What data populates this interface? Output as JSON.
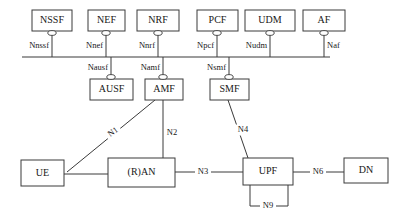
{
  "diagram": {
    "style": {
      "stroke_color": "#3a3a3a",
      "text_color": "#171717",
      "background": "#ffffff"
    },
    "service_bus": {
      "name": "service-based-interface-bus",
      "x1": 22,
      "y": 57,
      "x2": 330
    },
    "top_nodes": [
      {
        "id": "nssf",
        "label": "NSSF",
        "x": 32,
        "y": 10,
        "w": 40,
        "h": 21,
        "service": "Nnssf",
        "service_side": "left",
        "stem_x": 52
      },
      {
        "id": "nef",
        "label": "NEF",
        "x": 88,
        "y": 10,
        "w": 37,
        "h": 21,
        "service": "Nnef",
        "service_side": "left",
        "stem_x": 106
      },
      {
        "id": "nrf",
        "label": "NRF",
        "x": 137,
        "y": 10,
        "w": 42,
        "h": 21,
        "service": "Nnrf",
        "service_side": "left",
        "stem_x": 158
      },
      {
        "id": "pcf",
        "label": "PCF",
        "x": 197,
        "y": 10,
        "w": 41,
        "h": 21,
        "service": "Npcf",
        "service_side": "left",
        "stem_x": 217
      },
      {
        "id": "udm",
        "label": "UDM",
        "x": 245,
        "y": 10,
        "w": 50,
        "h": 21,
        "service": "Nudm",
        "service_side": "left",
        "stem_x": 270
      },
      {
        "id": "af",
        "label": "AF",
        "x": 303,
        "y": 10,
        "w": 42,
        "h": 21,
        "service": "Naf",
        "service_side": "right",
        "stem_x": 324
      }
    ],
    "mid_nodes": [
      {
        "id": "ausf",
        "label": "AUSF",
        "x": 90,
        "y": 79,
        "w": 43,
        "h": 21,
        "service": "Nausf",
        "service_side": "left",
        "stem_x": 111
      },
      {
        "id": "amf",
        "label": "AMF",
        "x": 145,
        "y": 79,
        "w": 38,
        "h": 21,
        "service": "Namf",
        "service_side": "left",
        "stem_x": 163
      },
      {
        "id": "smf",
        "label": "SMF",
        "x": 210,
        "y": 79,
        "w": 39,
        "h": 21,
        "service": "Nsmf",
        "service_side": "left",
        "stem_x": 229
      }
    ],
    "bottom_nodes": [
      {
        "id": "ue",
        "label": "UE",
        "x": 21,
        "y": 160,
        "w": 43,
        "h": 26
      },
      {
        "id": "ran",
        "label": "(R)AN",
        "x": 108,
        "y": 158,
        "w": 67,
        "h": 29
      },
      {
        "id": "upf",
        "label": "UPF",
        "x": 243,
        "y": 158,
        "w": 50,
        "h": 27
      },
      {
        "id": "dn",
        "label": "DN",
        "x": 344,
        "y": 158,
        "w": 44,
        "h": 25
      }
    ],
    "reference_points": [
      {
        "id": "n1",
        "label": "N1",
        "lx": 113,
        "ly": 132,
        "rotate": -36
      },
      {
        "id": "n2",
        "label": "N2",
        "lx": 172,
        "ly": 133,
        "rotate": 0
      },
      {
        "id": "n3",
        "label": "N3",
        "lx": 203,
        "ly": 172,
        "rotate": 0
      },
      {
        "id": "n4",
        "label": "N4",
        "lx": 243,
        "ly": 130,
        "rotate": 0
      },
      {
        "id": "n6",
        "label": "N6",
        "lx": 318,
        "ly": 172,
        "rotate": 0
      },
      {
        "id": "n9",
        "label": "N9",
        "lx": 268,
        "ly": 206,
        "rotate": 0
      }
    ],
    "connections": [
      {
        "id": "n1-link",
        "from": "amf",
        "to": "ue",
        "path": "M 155 100 L 67 172"
      },
      {
        "id": "n2-link",
        "from": "amf",
        "to": "ran",
        "path": "M 163 100 L 163 158"
      },
      {
        "id": "n3-link",
        "from": "ran",
        "to": "upf",
        "path": "M 175 172 L 243 172"
      },
      {
        "id": "n4-link",
        "from": "smf",
        "to": "upf",
        "path": "M 228 100 L 248 158"
      },
      {
        "id": "ue-ran-link",
        "from": "ue",
        "to": "ran",
        "path": "M 64 174 L 108 174"
      },
      {
        "id": "n6-link",
        "from": "upf",
        "to": "dn",
        "path": "M 293 172 L 344 172"
      },
      {
        "id": "n9-link",
        "from": "upf",
        "to": "upf",
        "path": "M 250 185 L 250 206 L 288 206 L 288 185"
      }
    ]
  }
}
